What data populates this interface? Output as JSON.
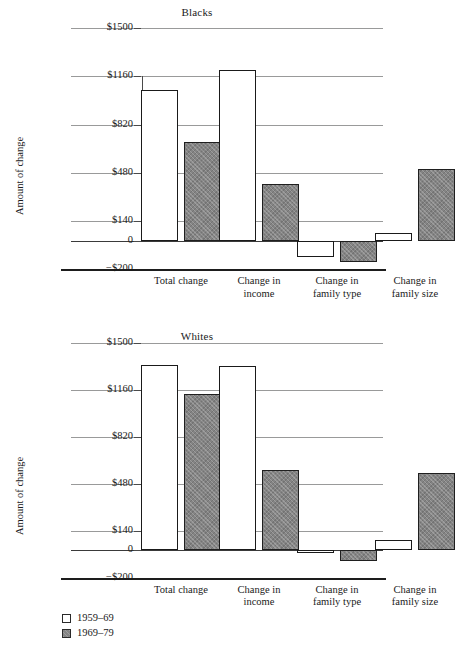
{
  "chart_data": [
    {
      "type": "bar",
      "title": "Blacks",
      "xlabel": "",
      "ylabel": "Amount of change",
      "categories": [
        "Total change",
        "Change in income",
        "Change in family type",
        "Change in family size"
      ],
      "category_lines": [
        [
          "Total change"
        ],
        [
          "Change in",
          "income"
        ],
        [
          "Change in",
          "family type"
        ],
        [
          "Change in",
          "family size"
        ]
      ],
      "series": [
        {
          "name": "1959-69",
          "values": [
            1060,
            1205,
            -110,
            55
          ]
        },
        {
          "name": "1969-79",
          "values": [
            700,
            400,
            -150,
            505
          ]
        }
      ],
      "yticks": [
        1500,
        1160,
        820,
        480,
        140,
        0,
        -200
      ],
      "ytick_labels": [
        "$1500",
        "$1160",
        "$820",
        "$480",
        "$140",
        "0",
        "−$200"
      ],
      "ylim": [
        -200,
        1500
      ],
      "grid": true,
      "legend_position": "below-bottom-chart"
    },
    {
      "type": "bar",
      "title": "Whites",
      "xlabel": "",
      "ylabel": "Amount of change",
      "categories": [
        "Total change",
        "Change in income",
        "Change in family type",
        "Change in family size"
      ],
      "category_lines": [
        [
          "Total change"
        ],
        [
          "Change in",
          "income"
        ],
        [
          "Change in",
          "family type"
        ],
        [
          "Change in",
          "family size"
        ]
      ],
      "series": [
        {
          "name": "1959-69",
          "values": [
            1340,
            1330,
            -25,
            70
          ]
        },
        {
          "name": "1969-79",
          "values": [
            1130,
            580,
            -80,
            560
          ]
        }
      ],
      "yticks": [
        1500,
        1160,
        820,
        480,
        140,
        0,
        -200
      ],
      "ytick_labels": [
        "$1500",
        "$1160",
        "$820",
        "$480",
        "$140",
        "0",
        "−$200"
      ],
      "ylim": [
        -200,
        1500
      ],
      "grid": true,
      "legend_position": "below"
    }
  ],
  "legend": {
    "items": [
      {
        "label": "1959–69",
        "style": "white"
      },
      {
        "label": "1969–79",
        "style": "gray"
      }
    ]
  },
  "colors": {
    "series_1959_69": "#ffffff",
    "series_1969_79": "#848484",
    "gridline": "#999a9a",
    "axis": "#1d1d1d",
    "text": "#1a1a1a"
  }
}
